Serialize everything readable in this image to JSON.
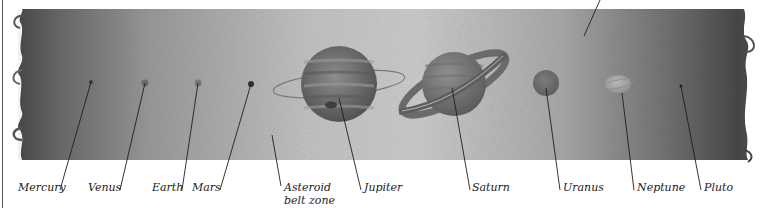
{
  "diagram": {
    "band": {
      "top": 9,
      "bottom": 160,
      "left": 22,
      "right": 744
    },
    "colors": {
      "band_edge": "#5a5a5a",
      "band_center": "#c9c9c9",
      "leader_line": "#1e1e1e",
      "label_text": "#222222"
    },
    "bodies": [
      {
        "id": "mercury",
        "label": "Mercury",
        "cx": 91,
        "cy": 82,
        "r": 2,
        "fill": "#3a3a3a",
        "line": [
          91,
          82,
          60,
          190
        ],
        "label_x": 18,
        "label_y": 181
      },
      {
        "id": "venus",
        "label": "Venus",
        "cx": 145,
        "cy": 83,
        "r": 3.5,
        "fill": "#6a6a6a",
        "line": [
          145,
          83,
          120,
          190
        ],
        "label_x": 88,
        "label_y": 181
      },
      {
        "id": "earth",
        "label": "Earth",
        "cx": 198,
        "cy": 83,
        "r": 3.5,
        "fill": "#777777",
        "line": [
          198,
          83,
          182,
          190
        ],
        "label_x": 152,
        "label_y": 181
      },
      {
        "id": "mars",
        "label": "Mars",
        "cx": 251,
        "cy": 84,
        "r": 3,
        "fill": "#2f2f2f",
        "line": [
          251,
          84,
          220,
          190
        ],
        "label_x": 192,
        "label_y": 181
      },
      {
        "id": "asteroid-belt",
        "label": "Asteroid belt zone",
        "label_lines": [
          "Asteroid",
          "belt zone"
        ],
        "line": [
          272,
          135,
          281,
          186
        ],
        "label_x": 284,
        "label_y": 181
      },
      {
        "id": "jupiter",
        "label": "Jupiter",
        "cx": 339,
        "cy": 84,
        "r": 38,
        "fill": "#6d6d6d",
        "line": [
          339,
          98,
          361,
          190
        ],
        "label_x": 364,
        "label_y": 181
      },
      {
        "id": "saturn",
        "label": "Saturn",
        "cx": 454,
        "cy": 84,
        "r": 32,
        "fill": "#7a7a7a",
        "line": [
          452,
          88,
          470,
          190
        ],
        "label_x": 472,
        "label_y": 181
      },
      {
        "id": "uranus",
        "label": "Uranus",
        "cx": 546,
        "cy": 83,
        "r": 13,
        "fill": "#6f6f6f",
        "line": [
          546,
          88,
          560,
          190
        ],
        "label_x": 563,
        "label_y": 181
      },
      {
        "id": "neptune",
        "label": "Neptune",
        "cx": 618,
        "cy": 84,
        "r": 13,
        "fill": "#9a9a9a",
        "line": [
          622,
          93,
          634,
          190
        ],
        "label_x": 637,
        "label_y": 181
      },
      {
        "id": "pluto",
        "label": "Pluto",
        "cx": 681,
        "cy": 86,
        "r": 1.5,
        "fill": "#222222",
        "line": [
          681,
          86,
          701,
          190
        ],
        "label_x": 704,
        "label_y": 181
      }
    ],
    "top_pointer": {
      "line": [
        584,
        36,
        600,
        0
      ]
    }
  }
}
